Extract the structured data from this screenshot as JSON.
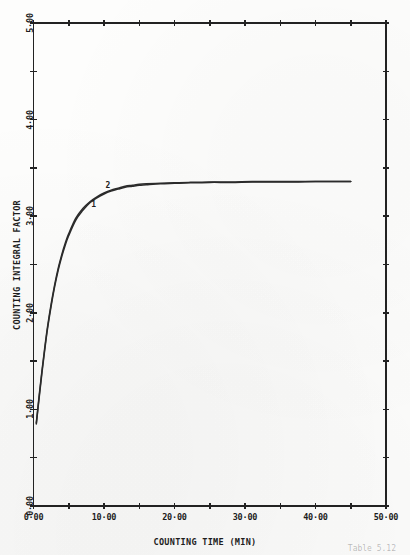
{
  "chart_data": {
    "type": "line",
    "title": "",
    "xlabel": "COUNTING TIME (MIN)",
    "ylabel": "COUNTING INTEGRAL FACTOR",
    "xlim": [
      0,
      50
    ],
    "ylim": [
      0,
      5
    ],
    "grid": false,
    "legend_position": "inline-curve-labels",
    "x_ticks_major": [
      0,
      10,
      20,
      30,
      40,
      50
    ],
    "x_tick_labels": [
      "0·00",
      "10·00",
      "20·00",
      "30·00",
      "40·00",
      "50·00"
    ],
    "x_ticks_minor": [
      5,
      15,
      25,
      35,
      45
    ],
    "y_ticks_major": [
      0,
      1,
      2,
      3,
      4,
      5
    ],
    "y_tick_labels": [
      "0·00",
      "1·00",
      "2·00",
      "3·00",
      "4·00",
      "5·00"
    ],
    "y_ticks_minor": [
      0.5,
      1.5,
      2.5,
      3.5,
      4.5
    ],
    "annotations": [
      {
        "text": "1",
        "x": 8.2,
        "y": 3.12
      },
      {
        "text": "2",
        "x": 10.2,
        "y": 3.31
      }
    ],
    "series": [
      {
        "name": "1",
        "x": [
          0.4,
          0.8,
          1.2,
          1.6,
          2.0,
          2.5,
          3.0,
          3.5,
          4.0,
          4.5,
          5.0,
          6.0,
          7.0,
          8.0,
          9.0,
          10.0,
          11.0,
          12.0,
          13.0,
          14.0,
          15.0,
          16.0,
          18.0,
          20.0,
          22.0,
          25.0,
          28.0,
          31.0,
          34.0,
          37.0,
          40.0,
          43.0,
          45.0
        ],
        "y": [
          0.85,
          1.12,
          1.38,
          1.62,
          1.84,
          2.07,
          2.27,
          2.44,
          2.58,
          2.7,
          2.8,
          2.96,
          3.06,
          3.14,
          3.19,
          3.23,
          3.26,
          3.28,
          3.3,
          3.31,
          3.32,
          3.325,
          3.335,
          3.34,
          3.345,
          3.35,
          3.35,
          3.355,
          3.355,
          3.355,
          3.36,
          3.36,
          3.36
        ]
      },
      {
        "name": "2",
        "x": [
          0.4,
          0.8,
          1.2,
          1.6,
          2.0,
          2.5,
          3.0,
          3.5,
          4.0,
          4.5,
          5.0,
          6.0,
          7.0,
          8.0,
          9.0,
          10.0,
          11.0,
          12.0,
          13.0,
          14.0,
          15.0,
          16.0,
          18.0,
          20.0,
          22.0,
          25.0,
          28.0,
          31.0,
          34.0,
          37.0,
          40.0,
          43.0,
          45.0
        ],
        "y": [
          0.86,
          1.14,
          1.4,
          1.64,
          1.86,
          2.09,
          2.29,
          2.46,
          2.6,
          2.72,
          2.82,
          2.98,
          3.08,
          3.15,
          3.2,
          3.24,
          3.27,
          3.29,
          3.31,
          3.32,
          3.33,
          3.335,
          3.34,
          3.345,
          3.35,
          3.355,
          3.355,
          3.36,
          3.36,
          3.36,
          3.36,
          3.36,
          3.36
        ]
      }
    ],
    "colors": {
      "curve": "#2b2b2b",
      "axis": "#222222",
      "text": "#1d1d1d",
      "background": "#fdfdfc"
    }
  },
  "caption_artifact": {
    "text": "Table 5.12"
  }
}
